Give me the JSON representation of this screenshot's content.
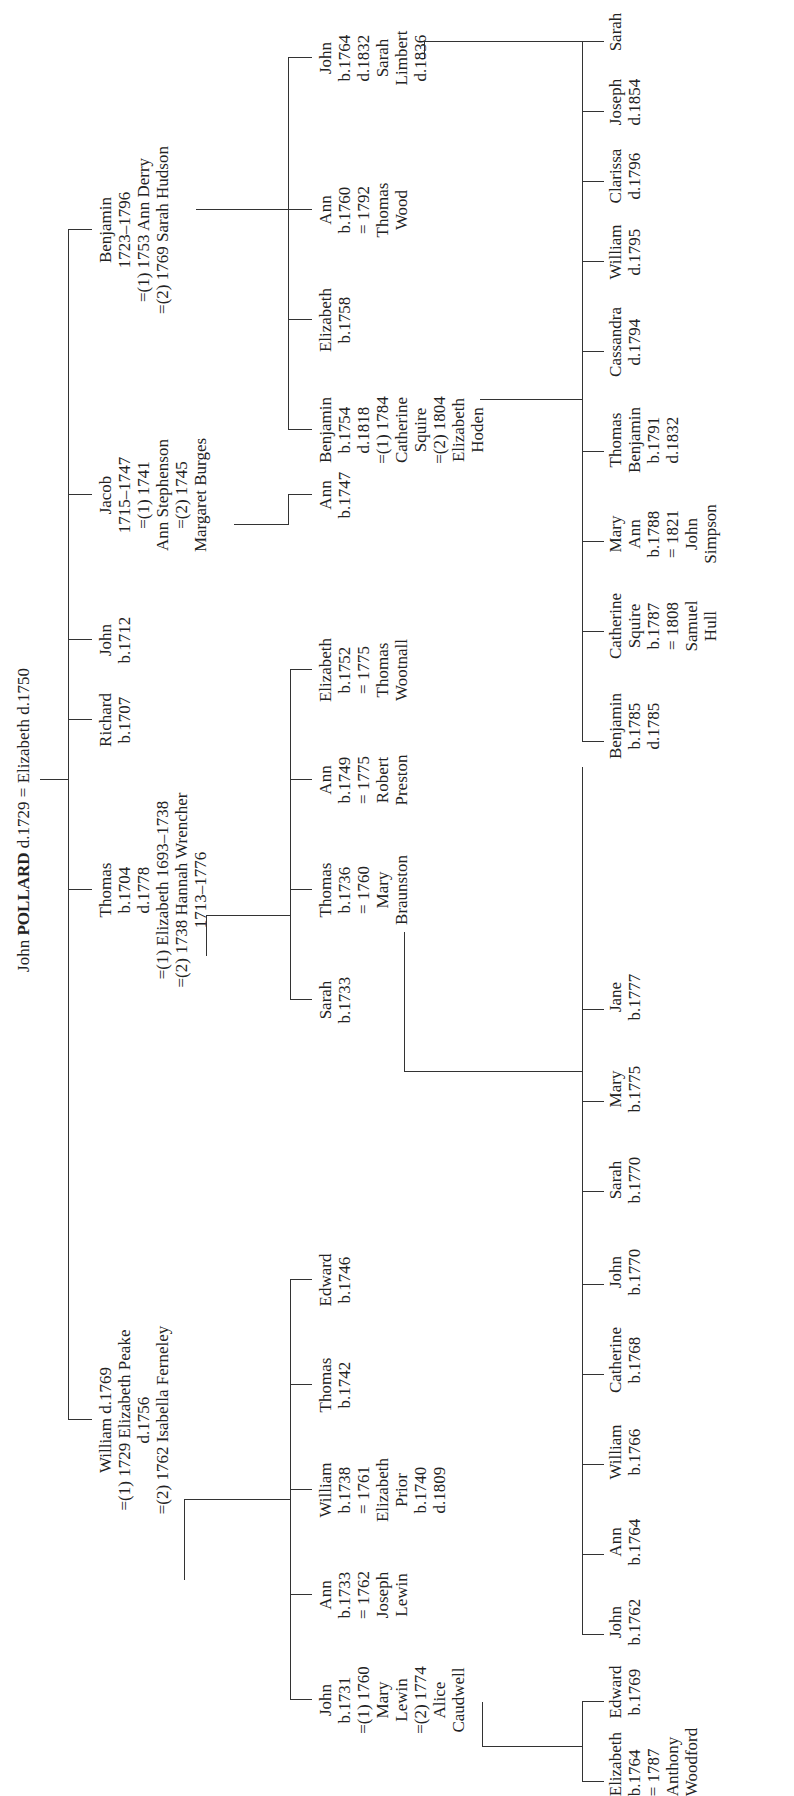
{
  "title": {
    "given": "John",
    "surname": "POLLARD",
    "rest": "d.1729 = Elizabeth d.1750"
  },
  "people": {
    "william": [
      "William d.1769",
      "=(1) 1729 Elizabeth Peake",
      "d.1756",
      "=(2) 1762 Isabella Ferneley"
    ],
    "thomas": [
      "Thomas",
      "b.1704",
      "d.1778",
      "=(1) Elizabeth 1693–1738",
      "=(2) 1738 Hannah Wrencher",
      "1713–1776"
    ],
    "richard": [
      "Richard",
      "b.1707"
    ],
    "john1712": [
      "John",
      "b.1712"
    ],
    "jacob": [
      "Jacob",
      "1715–1747",
      "=(1) 1741",
      "Ann Stephenson",
      "=(2) 1745",
      "Margaret Burges"
    ],
    "benjamin": [
      "Benjamin",
      "1723–1796",
      "=(1) 1753 Ann Derry",
      "=(2) 1769 Sarah Hudson"
    ],
    "w_john": [
      "John",
      "b.1731",
      "=(1) 1760",
      "Mary",
      "Lewin",
      "=(2) 1774",
      "Alice",
      "Caudwell"
    ],
    "w_ann": [
      "Ann",
      "b.1733",
      "= 1762",
      "Joseph",
      "Lewin"
    ],
    "w_william": [
      "William",
      "b.1738",
      "= 1761",
      "Elizabeth",
      "Prior",
      "b.1740",
      "d.1809"
    ],
    "w_thomas": [
      "Thomas",
      "b.1742"
    ],
    "w_edward": [
      "Edward",
      "b.1746"
    ],
    "t_sarah": [
      "Sarah",
      "b.1733"
    ],
    "t_thomas": [
      "Thomas",
      "b.1736",
      "= 1760",
      "Mary",
      "Braunston"
    ],
    "t_ann": [
      "Ann",
      "b.1749",
      "= 1775",
      "Robert",
      "Preston"
    ],
    "t_elizabeth": [
      "Elizabeth",
      "b.1752",
      "= 1775",
      "Thomas",
      "Wootnall"
    ],
    "j_ann": [
      "Ann",
      "b.1747"
    ],
    "b_benjamin": [
      "Benjamin",
      "b.1754",
      "d.1818",
      "=(1) 1784",
      "Catherine",
      "Squire",
      "=(2) 1804",
      "Elizabeth",
      "Hoden"
    ],
    "b_elizabeth": [
      "Elizabeth",
      "b.1758"
    ],
    "b_ann": [
      "Ann",
      "b.1760",
      "= 1792",
      "Thomas",
      "Wood"
    ],
    "b_john": [
      "John",
      "b.1764",
      "d.1832",
      "Sarah",
      "Limbert",
      "d.1836"
    ],
    "wj_elizabeth": [
      "Elizabeth",
      "b.1764",
      "= 1787",
      "Anthony",
      "Woodford"
    ],
    "wj_edward": [
      "Edward",
      "b.1769"
    ],
    "tt_john": [
      "John",
      "b.1762"
    ],
    "tt_ann": [
      "Ann",
      "b.1764"
    ],
    "tt_william": [
      "William",
      "b.1766"
    ],
    "tt_catherine": [
      "Catherine",
      "b.1768"
    ],
    "tt_john2": [
      "John",
      "b.1770"
    ],
    "tt_sarah": [
      "Sarah",
      "b.1770"
    ],
    "tt_mary": [
      "Mary",
      "b.1775"
    ],
    "tt_jane": [
      "Jane",
      "b.1777"
    ],
    "bb_benjamin": [
      "Benjamin",
      "b.1785",
      "d.1785"
    ],
    "bb_catherine": [
      "Catherine",
      "Squire",
      "b.1787",
      "= 1808",
      "Samuel",
      "Hull"
    ],
    "bb_maryann": [
      "Mary",
      "Ann",
      "b.1788",
      "= 1821",
      "John",
      "Simpson"
    ],
    "bb_thomas": [
      "Thomas",
      "Benjamin",
      "b.1791",
      "d.1832"
    ],
    "bb_cassandra": [
      "Cassandra",
      "d.1794"
    ],
    "bb_william": [
      "William",
      "d.1795"
    ],
    "bb_clarissa": [
      "Clarissa",
      "d.1796"
    ],
    "bb_joseph": [
      "Joseph",
      "d.1854"
    ],
    "bb_sarah": [
      "Sarah"
    ]
  }
}
